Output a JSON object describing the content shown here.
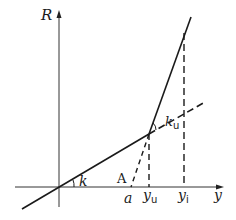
{
  "diagram": {
    "type": "piecewise-linear-graph",
    "axes": {
      "vertical_label": "R",
      "horizontal_label": "y"
    },
    "angles": {
      "k": "k",
      "k_u_base": "k",
      "k_u_sub": "u"
    },
    "points": {
      "A": "A",
      "a": "a"
    },
    "ticks": {
      "y_u_base": "y",
      "y_u_sub": "u",
      "y_i_base": "y",
      "y_i_sub": "i"
    },
    "colors": {
      "line": "#1a1a1a",
      "background": "#ffffff"
    }
  }
}
